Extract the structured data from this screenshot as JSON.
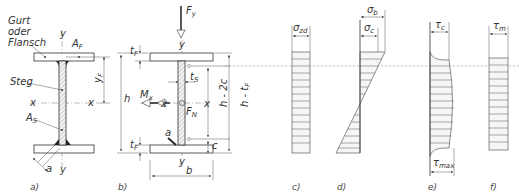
{
  "figure": {
    "panels": {
      "a": {
        "label": "a)",
        "texts": {
          "gurt": "Gurt",
          "oder": "oder",
          "flansch": "Flansch",
          "steg": "Steg",
          "AF": "A",
          "AF_sub": "F",
          "AS": "A",
          "AS_sub": "S",
          "y_top": "y",
          "y_bot": "y",
          "x_left": "x",
          "x_right": "x",
          "yF": "y",
          "yF_sub": "F",
          "h": "h",
          "a": "a"
        }
      },
      "b": {
        "label": "b)",
        "texts": {
          "Fy": "F",
          "Fy_sub": "y",
          "y_top": "y",
          "y_bot": "y",
          "tF_top": "t",
          "tF_sub": "F",
          "tF_bot": "t",
          "tS": "t",
          "tS_sub": "S",
          "Mx": "M",
          "Mx_sub": "x",
          "x_left": "x",
          "x_right": "x",
          "FN": "F",
          "FN_sub": "N",
          "a": "a",
          "b": "b",
          "h": "h",
          "c": "c",
          "h2c": "h - 2c",
          "htF": "h - t",
          "htF_sub": "F"
        }
      },
      "c": {
        "label": "c)",
        "sigma": "σ",
        "sigma_sub": "zd"
      },
      "d": {
        "label": "d)",
        "sigma_b": "σ",
        "sigma_b_sub": "b",
        "sigma_c": "σ",
        "sigma_c_sub": "c"
      },
      "e": {
        "label": "e)",
        "tau_c": "τ",
        "tau_c_sub": "c",
        "tau_max": "τ",
        "tau_max_sub": "max"
      },
      "f": {
        "label": "f)",
        "tau_m": "τ",
        "tau_m_sub": "m"
      }
    }
  }
}
